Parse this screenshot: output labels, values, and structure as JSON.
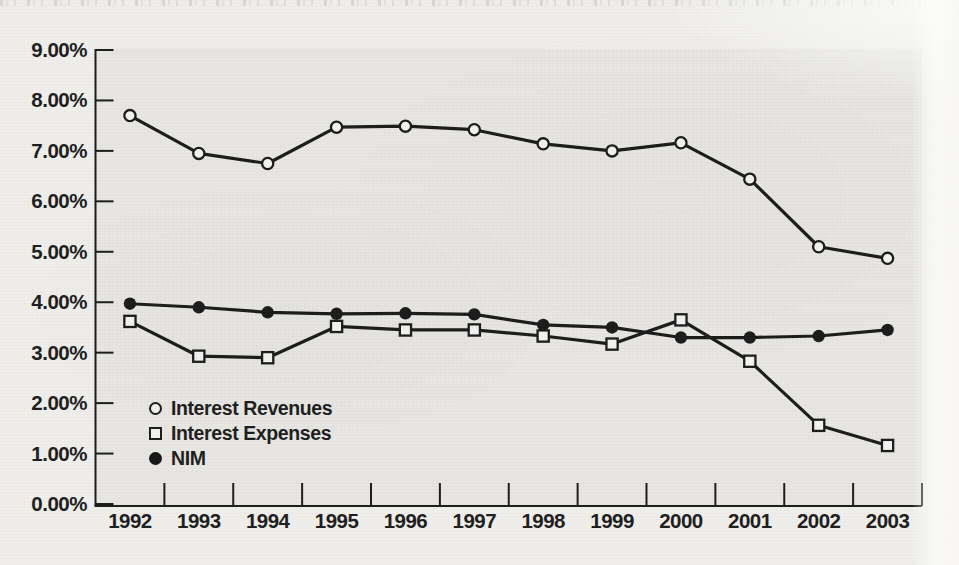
{
  "page": {
    "background_color": "#efeeea",
    "plot_background_color": "#e7e6e2",
    "ink_color": "#1a1a1a"
  },
  "chart_data": {
    "type": "line",
    "title": "",
    "xlabel": "",
    "ylabel": "",
    "categories": [
      "1992",
      "1993",
      "1994",
      "1995",
      "1996",
      "1997",
      "1998",
      "1999",
      "2000",
      "2001",
      "2002",
      "2003"
    ],
    "series": [
      {
        "name": "Interest Revenues",
        "marker": "open-circle",
        "values": [
          7.7,
          6.95,
          6.75,
          7.47,
          7.49,
          7.42,
          7.14,
          7.0,
          7.16,
          6.44,
          5.1,
          4.87
        ]
      },
      {
        "name": "Interest Expenses",
        "marker": "open-square",
        "values": [
          3.62,
          2.93,
          2.9,
          3.52,
          3.45,
          3.45,
          3.33,
          3.17,
          3.65,
          2.83,
          1.56,
          1.16
        ]
      },
      {
        "name": "NIM",
        "marker": "filled-circle",
        "values": [
          3.97,
          3.9,
          3.8,
          3.77,
          3.78,
          3.76,
          3.55,
          3.5,
          3.3,
          3.3,
          3.33,
          3.45
        ]
      }
    ],
    "ylim": [
      0,
      9
    ],
    "y_ticks": [
      {
        "value": 9,
        "label": "9.00%"
      },
      {
        "value": 8,
        "label": "8.00%"
      },
      {
        "value": 7,
        "label": "7.00%"
      },
      {
        "value": 6,
        "label": "6.00%"
      },
      {
        "value": 5,
        "label": "5.00%"
      },
      {
        "value": 4,
        "label": "4.00%"
      },
      {
        "value": 3,
        "label": "3.00%"
      },
      {
        "value": 2,
        "label": "2.00%"
      },
      {
        "value": 1,
        "label": "1.00%"
      },
      {
        "value": 0,
        "label": "0.00%"
      }
    ],
    "grid": false,
    "legend_position": "inside-lower-left"
  }
}
